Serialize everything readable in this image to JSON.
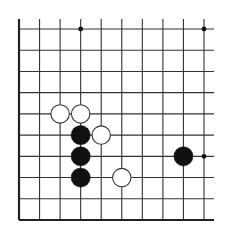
{
  "diagram": {
    "type": "go-board-fragment",
    "columns": 10,
    "rows": 10,
    "edges": {
      "left": true,
      "bottom": true,
      "top": false,
      "right": false
    },
    "colors": {
      "background": "#ffffff",
      "line": "#333333",
      "edge": "#222222",
      "black_stone": "#111111",
      "white_stone_fill": "#ffffff",
      "white_stone_stroke": "#333333",
      "star_point": "#111111"
    },
    "star_points": [
      {
        "col": 3,
        "row": 0
      },
      {
        "col": 9,
        "row": 0
      },
      {
        "col": 9,
        "row": 6
      }
    ],
    "stones": [
      {
        "color": "white",
        "col": 2,
        "row": 4
      },
      {
        "color": "white",
        "col": 3,
        "row": 4
      },
      {
        "color": "white",
        "col": 4,
        "row": 5
      },
      {
        "color": "white",
        "col": 5,
        "row": 7
      },
      {
        "color": "black",
        "col": 3,
        "row": 5
      },
      {
        "color": "black",
        "col": 3,
        "row": 6
      },
      {
        "color": "black",
        "col": 3,
        "row": 7
      },
      {
        "color": "black",
        "col": 8,
        "row": 6
      }
    ]
  }
}
